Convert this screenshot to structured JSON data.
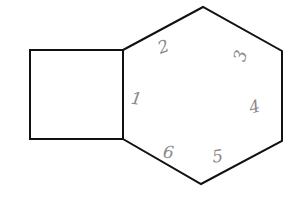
{
  "diagram": {
    "shapes": [
      {
        "id": "square",
        "type": "square"
      },
      {
        "id": "hexagon",
        "type": "hexagon"
      }
    ],
    "hexagon_labels": [
      "1",
      "2",
      "3",
      "4",
      "5",
      "6"
    ],
    "colors": {
      "stroke": "#111111",
      "handwriting": "#8a8a8a",
      "background": "#ffffff"
    }
  }
}
